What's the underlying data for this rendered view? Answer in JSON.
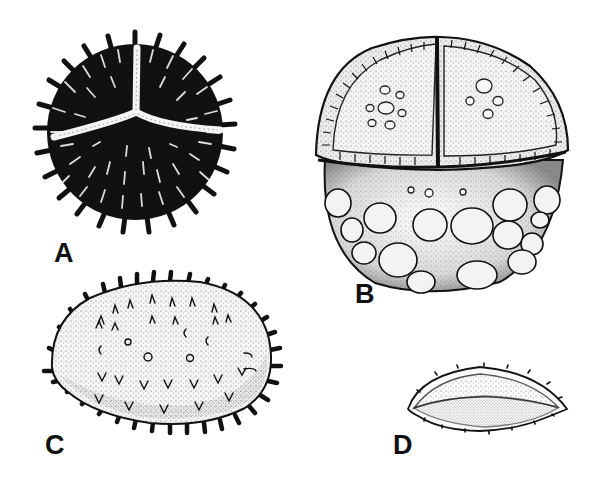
{
  "figure": {
    "panels": [
      {
        "id": "A",
        "label": "A",
        "subject": "spiny spherical spore with trilete mark"
      },
      {
        "id": "B",
        "label": "B",
        "subject": "spherical grain with segmented upper cap and rounded vesicles below"
      },
      {
        "id": "C",
        "label": "C",
        "subject": "ellipsoid spiny grain"
      },
      {
        "id": "D",
        "label": "D",
        "subject": "lens-shaped grain with small marginal spines"
      }
    ],
    "colors": {
      "ink": "#111111",
      "background": "#ffffff",
      "stipple": "#555555"
    }
  }
}
